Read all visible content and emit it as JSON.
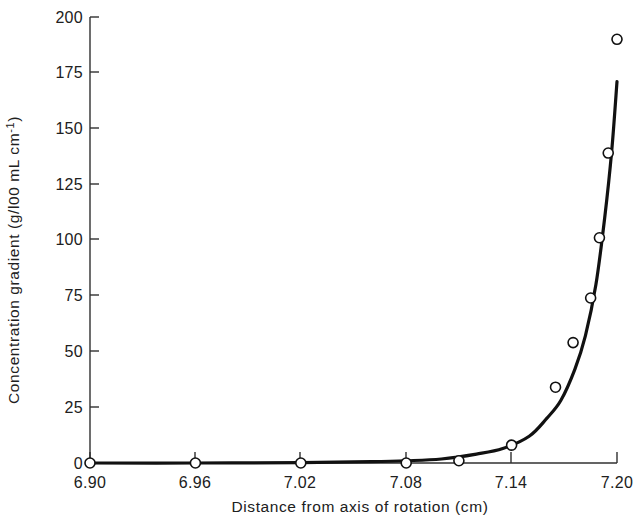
{
  "chart_data": {
    "type": "line",
    "title": "",
    "xlabel": "Distance from axis of rotation (cm)",
    "ylabel": "Concentration gradient (g/l00 mL cm",
    "ylabel_superscript": "-1",
    "ylabel_suffix": ")",
    "xlim": [
      6.9,
      7.2
    ],
    "ylim": [
      0,
      200
    ],
    "grid": false,
    "legend": null,
    "xticks": [
      "6.90",
      "6.96",
      "7.02",
      "7.08",
      "7.14",
      "7.20"
    ],
    "xtick_values": [
      6.9,
      6.96,
      7.02,
      7.08,
      7.14,
      7.2
    ],
    "yticks": [
      "0",
      "25",
      "50",
      "75",
      "100",
      "125",
      "150",
      "175",
      "200"
    ],
    "ytick_values": [
      0,
      25,
      50,
      75,
      100,
      125,
      150,
      175,
      200
    ],
    "series": [
      {
        "name": "measured concentration gradient",
        "marker": "open-circle",
        "x": [
          6.9,
          6.96,
          7.02,
          7.08,
          7.11,
          7.14,
          7.165,
          7.175,
          7.185,
          7.19,
          7.195,
          7.2
        ],
        "values": [
          0,
          0,
          0,
          0,
          1,
          8,
          34,
          54,
          74,
          101,
          139,
          190
        ]
      },
      {
        "name": "fitted curve",
        "marker": "none",
        "x": [
          6.9,
          6.96,
          7.02,
          7.06,
          7.08,
          7.1,
          7.12,
          7.135,
          7.15,
          7.16,
          7.168,
          7.176,
          7.182,
          7.188,
          7.193,
          7.197,
          7.2
        ],
        "values": [
          0,
          0,
          0.2,
          0.6,
          1.0,
          1.8,
          4.0,
          6.5,
          12.0,
          20.0,
          28.0,
          42.0,
          57.0,
          80.0,
          110.0,
          140.0,
          171.0
        ]
      }
    ],
    "colors": {
      "curve": "#111111",
      "marker_fill": "#ffffff",
      "marker_stroke": "#111111",
      "axis": "#303030",
      "text": "#202020",
      "background": "#ffffff"
    }
  }
}
